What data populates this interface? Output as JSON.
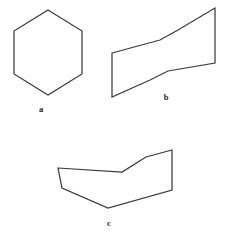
{
  "figure": {
    "width": 230,
    "height": 237,
    "background_color": "#ffffff",
    "stroke_color": "#3b3b3b",
    "stroke_width": 1.25,
    "label_color": "#242424"
  },
  "shapes": [
    {
      "id": "a",
      "label": "a",
      "name": "hexagon",
      "closed": true,
      "self_intersecting": false,
      "label_position": {
        "x": 41,
        "y": 105
      },
      "points": [
        {
          "x": 48,
          "y": 10
        },
        {
          "x": 82,
          "y": 31
        },
        {
          "x": 82,
          "y": 74
        },
        {
          "x": 48,
          "y": 95
        },
        {
          "x": 14,
          "y": 74
        },
        {
          "x": 14,
          "y": 31
        }
      ]
    },
    {
      "id": "b",
      "label": "b",
      "name": "zigzag-ribbon-polygon",
      "closed": true,
      "self_intersecting": false,
      "label_position": {
        "x": 166,
        "y": 93
      },
      "points": [
        {
          "x": 112,
          "y": 53
        },
        {
          "x": 160,
          "y": 40
        },
        {
          "x": 178,
          "y": 30
        },
        {
          "x": 215,
          "y": 8
        },
        {
          "x": 215,
          "y": 63
        },
        {
          "x": 168,
          "y": 71
        },
        {
          "x": 150,
          "y": 80
        },
        {
          "x": 112,
          "y": 97
        }
      ]
    },
    {
      "id": "c",
      "label": "c",
      "name": "self-intersecting-polygon",
      "closed": true,
      "self_intersecting": true,
      "label_position": {
        "x": 109,
        "y": 219
      },
      "points": [
        {
          "x": 58,
          "y": 168
        },
        {
          "x": 122,
          "y": 172
        },
        {
          "x": 146,
          "y": 157
        },
        {
          "x": 172,
          "y": 150
        },
        {
          "x": 172,
          "y": 190
        },
        {
          "x": 108,
          "y": 208
        },
        {
          "x": 62,
          "y": 188
        }
      ]
    }
  ]
}
